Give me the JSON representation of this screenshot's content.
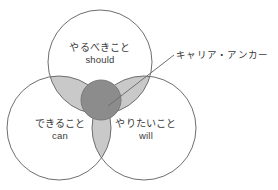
{
  "diagram": {
    "type": "venn-3-circle",
    "background_color": "#ffffff",
    "stroke_color": "#6e6e6e",
    "lens_fill_color": "#c9c9c9",
    "center_fill_color": "#8c8c8c",
    "circles": [
      {
        "id": "should",
        "position": "top",
        "label_jp": "やるべきこと",
        "label_en": "should",
        "cx": 100,
        "cy": 62,
        "r": 52
      },
      {
        "id": "can",
        "position": "bottom-left",
        "label_jp": "できること",
        "label_en": "can",
        "cx": 59,
        "cy": 128,
        "r": 52
      },
      {
        "id": "will",
        "position": "bottom-right",
        "label_jp": "やりたいこと",
        "label_en": "will",
        "cx": 144,
        "cy": 128,
        "r": 52
      }
    ],
    "center": {
      "id": "career-anchor",
      "label": "キャリア・アンカー",
      "cx": 101,
      "cy": 100,
      "r": 20
    },
    "callout": {
      "label": "キャリア・アンカー",
      "line_from_x": 108,
      "line_from_y": 106,
      "line_to_x": 174,
      "line_to_y": 55
    }
  }
}
